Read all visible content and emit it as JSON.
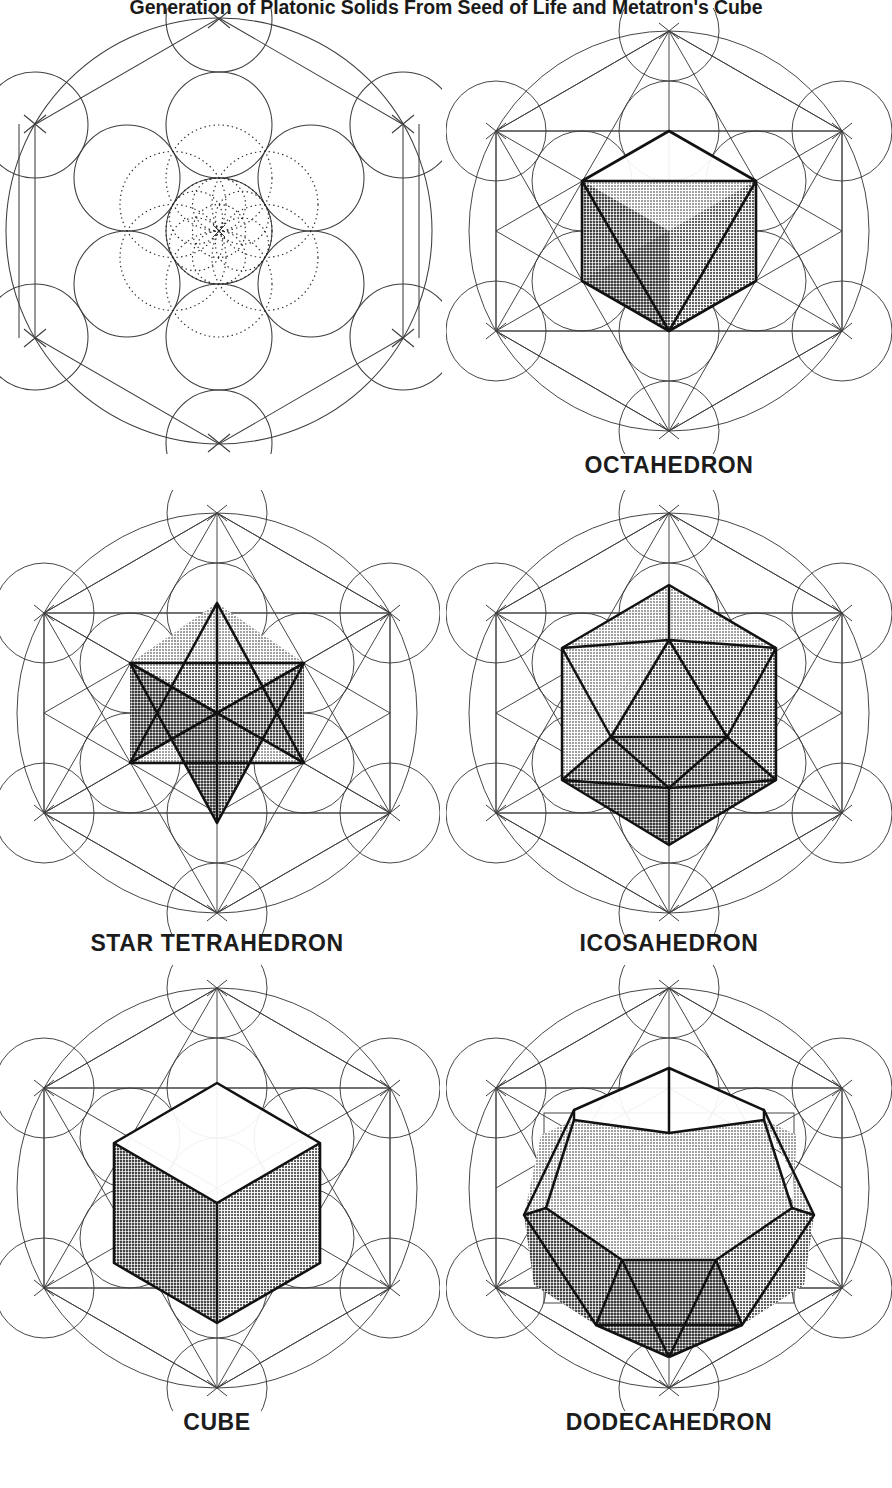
{
  "title": "Generation of Platonic Solids From Seed of Life and Metatron's Cube",
  "colors": {
    "ink": "#1a1a1a",
    "line_thin": "#3a3a3a",
    "line_bold": "#121212",
    "face_light": "#cfcfcf",
    "face_mid": "#a9a9a9",
    "face_dark": "#8a8a8a",
    "face_darker": "#7a7a7a",
    "white": "#ffffff",
    "background": "#ffffff"
  },
  "layout": {
    "columns": 2,
    "rows": 3,
    "panel_width": 446,
    "panel_height": 496
  },
  "panels": [
    {
      "id": "seed-of-life",
      "caption": "",
      "solid": "none",
      "description": "Seed of Life and Metatron's Cube base construction with thirteen circles, outer circle, hexagon and dotted inner seed of life"
    },
    {
      "id": "octahedron",
      "caption": "OCTAHEDRON",
      "solid": "octahedron",
      "faces": 8,
      "description": "Octahedron in isometric projection over Metatron's Cube"
    },
    {
      "id": "star-tetrahedron",
      "caption": "STAR TETRAHEDRON",
      "solid": "star-tetrahedron",
      "faces": 8,
      "description": "Two interpenetrating tetrahedra forming a Merkaba over Metatron's Cube"
    },
    {
      "id": "icosahedron",
      "caption": "ICOSAHEDRON",
      "solid": "icosahedron",
      "faces": 20,
      "description": "Icosahedron with twenty triangular faces over Metatron's Cube"
    },
    {
      "id": "cube",
      "caption": "CUBE",
      "solid": "cube",
      "faces": 6,
      "description": "Cube in isometric projection over Metatron's Cube"
    },
    {
      "id": "dodecahedron",
      "caption": "DODECAHEDRON",
      "solid": "dodecahedron",
      "faces": 12,
      "description": "Dodecahedron with twelve pentagonal faces over Metatron's Cube"
    }
  ]
}
